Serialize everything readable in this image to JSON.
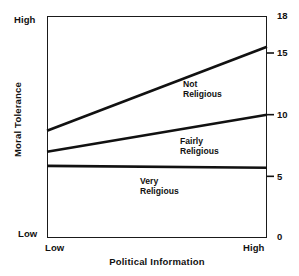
{
  "chart_data": {
    "type": "line",
    "title": "",
    "xlabel": "Political Information",
    "ylabel": "Moral Tolerance",
    "x_tick_labels": [
      "Low",
      "High"
    ],
    "y_end_labels": {
      "top": "High",
      "bottom": "Low"
    },
    "right_axis_ticks": [
      0,
      5,
      10,
      15,
      18
    ],
    "ylim": [
      0,
      18
    ],
    "xlim": [
      0,
      1
    ],
    "grid": false,
    "legend_position": "inline-annotation",
    "x": [
      0,
      1
    ],
    "series": [
      {
        "name": "Not Religious",
        "label_line1": "Not",
        "label_line2": "Religious",
        "values": [
          8.7,
          15.5
        ]
      },
      {
        "name": "Fairly Religious",
        "label_line1": "Fairly",
        "label_line2": "Religious",
        "values": [
          7.0,
          10.0
        ]
      },
      {
        "name": "Very Religious",
        "label_line1": "Very",
        "label_line2": "Religious",
        "values": [
          5.85,
          5.7
        ]
      }
    ]
  },
  "colors": {
    "line": "#111111",
    "frame": "#1a1a1a",
    "text": "#111111",
    "background": "#ffffff"
  },
  "ticks": {
    "t18": "18",
    "t15": "15",
    "t10": "10",
    "t5": "5",
    "t0": "0"
  },
  "top_artifact": ""
}
